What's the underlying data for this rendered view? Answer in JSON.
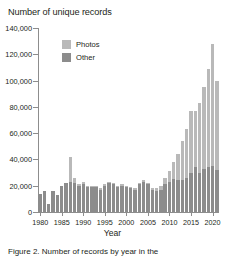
{
  "chart_data": {
    "type": "bar",
    "subtype": "stacked-bar",
    "title": "Number of unique records",
    "xlabel": "Year",
    "ylabel": "",
    "ylim": [
      0,
      140000
    ],
    "ytick_labels": [
      "0",
      "20,000",
      "40,000",
      "60,000",
      "80,000",
      "100,000",
      "120,000",
      "140,000"
    ],
    "ytick_values": [
      0,
      20000,
      40000,
      60000,
      80000,
      100000,
      120000,
      140000
    ],
    "xtick_labels": [
      "1980",
      "1985",
      "1990",
      "1995",
      "2000",
      "2005",
      "2010",
      "2015",
      "2020"
    ],
    "xtick_values": [
      1980,
      1985,
      1990,
      1995,
      2000,
      2005,
      2010,
      2015,
      2020
    ],
    "grid": false,
    "legend_position": "upper-left-inside",
    "categories": [
      1980,
      1981,
      1982,
      1983,
      1984,
      1985,
      1986,
      1987,
      1988,
      1989,
      1990,
      1991,
      1992,
      1993,
      1994,
      1995,
      1996,
      1997,
      1998,
      1999,
      2000,
      2001,
      2002,
      2003,
      2004,
      2005,
      2006,
      2007,
      2008,
      2009,
      2010,
      2011,
      2012,
      2013,
      2014,
      2015,
      2016,
      2017,
      2018,
      2019,
      2020,
      2021
    ],
    "series": [
      {
        "name": "Other",
        "color": "#8c8c8c",
        "values": [
          14000,
          16000,
          6000,
          16000,
          13000,
          20000,
          22000,
          23000,
          22000,
          20000,
          21000,
          19000,
          19000,
          19000,
          17000,
          20000,
          22000,
          21000,
          19000,
          20000,
          19000,
          18000,
          17000,
          21000,
          23000,
          21000,
          17000,
          16000,
          17000,
          21000,
          23000,
          25000,
          24000,
          24000,
          26000,
          30000,
          34000,
          30000,
          33000,
          34000,
          35000,
          32000
        ]
      },
      {
        "name": "Photos",
        "color": "#b9b9b9",
        "values": [
          0,
          0,
          0,
          0,
          0,
          0,
          0,
          19000,
          4000,
          1000,
          2000,
          1000,
          1000,
          1000,
          1000,
          1000,
          1000,
          1000,
          1000,
          1000,
          1000,
          1000,
          1000,
          1000,
          1000,
          1000,
          1000,
          2000,
          3000,
          5000,
          8000,
          13000,
          20000,
          30000,
          37000,
          47000,
          43000,
          53000,
          62000,
          75000,
          93000,
          68000
        ]
      }
    ],
    "totals": [
      14000,
      16000,
      6000,
      16000,
      13000,
      20000,
      22000,
      42000,
      26000,
      21000,
      23000,
      20000,
      20000,
      20000,
      18000,
      21000,
      23000,
      22000,
      20000,
      21000,
      20000,
      19000,
      18000,
      22000,
      24000,
      22000,
      18000,
      18000,
      20000,
      26000,
      31000,
      38000,
      44000,
      54000,
      63000,
      77000,
      77000,
      83000,
      95000,
      109000,
      128000,
      100000
    ]
  },
  "legend": {
    "items": [
      {
        "label": "Photos",
        "color": "#b9b9b9"
      },
      {
        "label": "Other",
        "color": "#8c8c8c"
      }
    ]
  },
  "caption": {
    "text": "Figure 2. Number of records by year in the"
  }
}
